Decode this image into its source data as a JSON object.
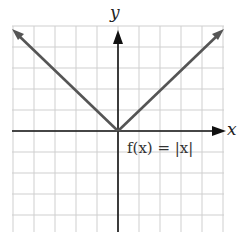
{
  "chart_data": {
    "type": "line",
    "title": "",
    "xlabel": "x",
    "ylabel": "y",
    "annotation": "f(x) = |x|",
    "series": [
      {
        "name": "f(x) = |x|",
        "x": [
          -5,
          0,
          5
        ],
        "y": [
          5,
          0,
          5
        ]
      }
    ],
    "xlim": [
      -5,
      5
    ],
    "ylim": [
      -5,
      5
    ],
    "grid": true,
    "legend": "none",
    "colors": {
      "line": "#555555",
      "grid": "#cfcfcf",
      "axis": "#111111"
    }
  },
  "labels": {
    "x_axis": "x",
    "y_axis": "y",
    "function": "f(x) = |x|"
  }
}
